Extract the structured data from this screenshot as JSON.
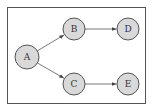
{
  "diagram": {
    "type": "directed-graph",
    "colors": {
      "background": "#ffffff",
      "frame": "#555555",
      "node_fill": "#d9d9d9",
      "node_stroke": "#444444",
      "edge": "#555555",
      "label": "#333333"
    },
    "frame": {
      "x": 7,
      "y": 7,
      "width": 138,
      "height": 96
    },
    "nodes": [
      {
        "id": "A",
        "label": "A",
        "cx": 27,
        "cy": 57,
        "r": 12
      },
      {
        "id": "B",
        "label": "B",
        "cx": 74,
        "cy": 29,
        "r": 11
      },
      {
        "id": "C",
        "label": "C",
        "cx": 74,
        "cy": 84,
        "r": 11
      },
      {
        "id": "D",
        "label": "D",
        "cx": 128,
        "cy": 29,
        "r": 11
      },
      {
        "id": "E",
        "label": "E",
        "cx": 128,
        "cy": 84,
        "r": 11
      }
    ],
    "edges": [
      {
        "from": "A",
        "to": "B"
      },
      {
        "from": "A",
        "to": "C"
      },
      {
        "from": "B",
        "to": "D"
      },
      {
        "from": "C",
        "to": "E"
      }
    ]
  }
}
